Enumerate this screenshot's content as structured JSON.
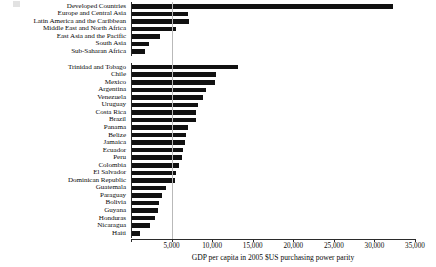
{
  "chart_data": {
    "type": "bar",
    "orientation": "horizontal",
    "title": "",
    "subtitle": "",
    "xlabel": "GDP per capita in 2005 $US purchasing power parity",
    "ylabel": "",
    "xlim": [
      0,
      35000
    ],
    "xticks": [
      0,
      5000,
      10000,
      15000,
      20000,
      25000,
      30000,
      35000
    ],
    "xtick_labels": [
      "",
      "5,000",
      "10,000",
      "15,000",
      "20,000",
      "25,000",
      "30,000",
      "35,000"
    ],
    "grid": "single vertical gridline at 5,000",
    "legend": "none",
    "bar_color": "#111111",
    "groups": [
      {
        "name": "regions",
        "categories": [
          "Developed Countries",
          "Europe and Central Asia",
          "Latin America and the Caribbean",
          "Middle East and North Africa",
          "East Asia and the Pacific",
          "South Asia",
          "Sub-Saharan Africa"
        ],
        "values": [
          32300,
          7000,
          7150,
          5600,
          3600,
          2200,
          1750
        ]
      },
      {
        "name": "countries",
        "categories": [
          "Trinidad and Tobago",
          "Chile",
          "Mexico",
          "Argentina",
          "Venezuela",
          "Uruguay",
          "Costa Rica",
          "Brazil",
          "Panama",
          "Belize",
          "Jamaica",
          "Ecuador",
          "Peru",
          "Colombia",
          "El Salvador",
          "Dominican Republic",
          "Guatemala",
          "Paraguay",
          "Bolivia",
          "Guyana",
          "Honduras",
          "Nicaragua",
          "Haiti"
        ],
        "values": [
          13200,
          10500,
          10400,
          9300,
          8900,
          8300,
          8000,
          7950,
          7000,
          6800,
          6700,
          6400,
          6300,
          5900,
          5500,
          5400,
          4300,
          3800,
          3400,
          3300,
          3000,
          2400,
          1100
        ]
      }
    ]
  },
  "axis": {
    "title": "GDP per capita in 2005 $US purchasing power parity"
  }
}
